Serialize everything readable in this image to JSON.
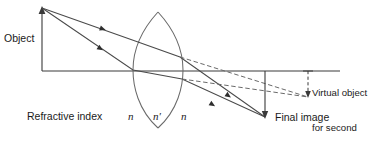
{
  "figure": {
    "kind": "optics-ray-diagram",
    "width": 387,
    "height": 141,
    "background_color": "#ffffff",
    "line_color": "#3a3a3a",
    "text_color": "#1a1a1a"
  },
  "labels": {
    "object": "Object",
    "refractive_index": "Refractive index",
    "n_left": "n",
    "n_prime": "n′",
    "n_right": "n",
    "virtual_object_line1": "Virtual object",
    "virtual_object_line2": "for second",
    "virtual_object_line3": "surface",
    "final_image": "Final image"
  },
  "geometry": {
    "optical_axis": {
      "x1": 42,
      "y1": 71,
      "x2": 340,
      "y2": 71
    },
    "object_arrow": {
      "x": 42,
      "y_base": 71,
      "y_tip": 8
    },
    "lens": {
      "left_vertex_x": 133,
      "right_vertex_x": 183,
      "center_x": 158,
      "top_y": 12,
      "bottom_y": 128
    },
    "final_image_arrow": {
      "x": 265,
      "y_base": 71,
      "y_tip": 118
    },
    "virtual_object_arrow": {
      "x": 308,
      "y_base": 71,
      "y_tip": 97
    },
    "rays_solid": [
      {
        "name": "upper-ray",
        "points": "42,8 138,42 180,57 265,117"
      },
      {
        "name": "lower-ray",
        "points": "42,8 133,70 182,79 265,117"
      }
    ],
    "rays_dashed": [
      {
        "name": "upper-virtual-extension",
        "points": "180,57 308,97"
      },
      {
        "name": "lower-virtual-extension",
        "points": "182,79 308,97"
      }
    ],
    "ray_arrowheads": [
      {
        "name": "incident-upper-arrowhead",
        "x": 100,
        "y": 28,
        "angle": 19
      },
      {
        "name": "incident-lower-arrowhead",
        "x": 98,
        "y": 47,
        "angle": 34
      },
      {
        "name": "emergent-upper-arrowhead",
        "x": 225,
        "y": 95,
        "angle": 35
      },
      {
        "name": "emergent-lower-arrowhead",
        "x": 210,
        "y": 103,
        "angle": 31
      }
    ]
  }
}
